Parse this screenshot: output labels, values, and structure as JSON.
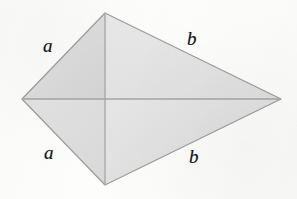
{
  "figure": {
    "name": "kite-with-diagonals",
    "shape_type": "kite",
    "background_color": "#fdfdfc",
    "fill_color": "#e3e3e3",
    "stroke_color": "#9a9a9a",
    "label_color": "#17171a",
    "vertices": {
      "top": {
        "x": 105,
        "y": 13
      },
      "left": {
        "x": 22,
        "y": 99
      },
      "right": {
        "x": 281,
        "y": 99
      },
      "bottom": {
        "x": 105,
        "y": 185
      }
    },
    "diagonal_intersection": {
      "x": 105,
      "y": 99
    },
    "facets": [
      {
        "name": "top-left-facet",
        "fill": "#dcdcdc"
      },
      {
        "name": "top-right-facet",
        "fill": "#e4e4e4"
      },
      {
        "name": "bottom-left-facet",
        "fill": "#dfdfdf"
      },
      {
        "name": "bottom-right-facet",
        "fill": "#e1e1e1"
      }
    ]
  },
  "labels": {
    "a_top": "a",
    "b_top": "b",
    "a_bottom": "a",
    "b_bottom": "b"
  },
  "background_text": {
    "line1": "",
    "line2": ""
  }
}
